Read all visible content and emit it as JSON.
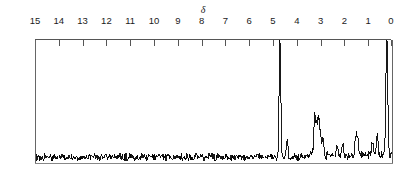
{
  "figure": {
    "kind": "nmr-spectrum",
    "axis_symbol": "δ",
    "width": 401,
    "height": 172,
    "stroke_color": "#000000",
    "frame_color": "#555555",
    "background": "#ffffff"
  },
  "chart_data": {
    "type": "line",
    "title": "",
    "xlabel": "δ",
    "ylabel": "",
    "xlim": [
      15,
      0
    ],
    "ylim": [
      0,
      1
    ],
    "grid": false,
    "legend": null,
    "axis_reversed": true,
    "tick_labels": [
      "15",
      "14",
      "13",
      "12",
      "11",
      "10",
      "9",
      "8",
      "7",
      "6",
      "5",
      "4",
      "3",
      "2",
      "1",
      "0"
    ],
    "tick_values": [
      15,
      14,
      13,
      12,
      11,
      10,
      9,
      8,
      7,
      6,
      5,
      4,
      3,
      2,
      1,
      0
    ],
    "annotations": [
      {
        "text": "δ",
        "x": 8.05,
        "y": 1.06
      }
    ],
    "peaks": [
      {
        "x": 4.72,
        "height": 1.0,
        "width": 0.045,
        "label": ""
      },
      {
        "x": 0.22,
        "height": 1.0,
        "width": 0.05,
        "label": ""
      },
      {
        "x": 3.26,
        "height": 0.3,
        "width": 0.05,
        "label": ""
      },
      {
        "x": 3.18,
        "height": 0.22,
        "width": 0.05,
        "label": ""
      },
      {
        "x": 3.1,
        "height": 0.27,
        "width": 0.05,
        "label": ""
      },
      {
        "x": 3.02,
        "height": 0.18,
        "width": 0.05,
        "label": ""
      },
      {
        "x": 2.92,
        "height": 0.13,
        "width": 0.05,
        "label": ""
      },
      {
        "x": 1.52,
        "height": 0.15,
        "width": 0.05,
        "label": ""
      },
      {
        "x": 1.44,
        "height": 0.12,
        "width": 0.05,
        "label": ""
      },
      {
        "x": 0.82,
        "height": 0.13,
        "width": 0.05,
        "label": ""
      },
      {
        "x": 0.62,
        "height": 0.16,
        "width": 0.05,
        "label": ""
      },
      {
        "x": 4.42,
        "height": 0.12,
        "width": 0.05,
        "label": ""
      },
      {
        "x": 2.3,
        "height": 0.09,
        "width": 0.05,
        "label": ""
      },
      {
        "x": 2.08,
        "height": 0.08,
        "width": 0.05,
        "label": ""
      }
    ],
    "baseline_noise": {
      "amplitude": 0.055,
      "description": "random noise along baseline across full 15–0 ppm range"
    },
    "series": [
      {
        "name": "1H NMR trace",
        "x": [
          15.0,
          14.9,
          14.8,
          14.7,
          14.6,
          14.5,
          14.4,
          14.3,
          14.2,
          14.1,
          14.0,
          13.9,
          13.8,
          13.7,
          13.6,
          13.5,
          13.4,
          13.3,
          13.2,
          13.1,
          13.0,
          12.9,
          12.8,
          12.7,
          12.6,
          12.5,
          12.4,
          12.3,
          12.2,
          12.1,
          12.0,
          11.9,
          11.8,
          11.7,
          11.6,
          11.5,
          11.4,
          11.3,
          11.2,
          11.1,
          11.0,
          10.9,
          10.8,
          10.7,
          10.6,
          10.5,
          10.4,
          10.3,
          10.2,
          10.1,
          10.0,
          9.9,
          9.8,
          9.7,
          9.6,
          9.5,
          9.4,
          9.3,
          9.2,
          9.1,
          9.0,
          8.9,
          8.8,
          8.7,
          8.6,
          8.5,
          8.4,
          8.3,
          8.2,
          8.1,
          8.0,
          7.9,
          7.8,
          7.7,
          7.6,
          7.5,
          7.4,
          7.3,
          7.2,
          7.1,
          7.0,
          6.9,
          6.8,
          6.7,
          6.6,
          6.5,
          6.4,
          6.3,
          6.2,
          6.1,
          6.0,
          5.9,
          5.8,
          5.7,
          5.6,
          5.5,
          5.4,
          5.3,
          5.2,
          5.1,
          5.0,
          4.9,
          4.8,
          4.72,
          4.6,
          4.5,
          4.4,
          4.3,
          4.2,
          4.1,
          4.0,
          3.9,
          3.8,
          3.7,
          3.6,
          3.5,
          3.4,
          3.3,
          3.2,
          3.1,
          3.0,
          2.9,
          2.8,
          2.7,
          2.6,
          2.5,
          2.4,
          2.3,
          2.2,
          2.1,
          2.0,
          1.9,
          1.8,
          1.7,
          1.6,
          1.5,
          1.4,
          1.3,
          1.2,
          1.1,
          1.0,
          0.9,
          0.8,
          0.7,
          0.6,
          0.5,
          0.4,
          0.3,
          0.22,
          0.1,
          0.0
        ],
        "y": [
          0.04,
          0.06,
          0.03,
          0.07,
          0.04,
          0.05,
          0.08,
          0.03,
          0.06,
          0.04,
          0.07,
          0.05,
          0.03,
          0.08,
          0.04,
          0.06,
          0.05,
          0.03,
          0.07,
          0.04,
          0.06,
          0.08,
          0.03,
          0.05,
          0.07,
          0.04,
          0.06,
          0.03,
          0.08,
          0.05,
          0.04,
          0.07,
          0.06,
          0.03,
          0.05,
          0.08,
          0.04,
          0.06,
          0.03,
          0.07,
          0.05,
          0.04,
          0.08,
          0.06,
          0.03,
          0.05,
          0.07,
          0.04,
          0.06,
          0.08,
          0.03,
          0.05,
          0.04,
          0.07,
          0.06,
          0.03,
          0.08,
          0.05,
          0.04,
          0.06,
          0.07,
          0.03,
          0.05,
          0.08,
          0.04,
          0.06,
          0.03,
          0.07,
          0.05,
          0.04,
          0.08,
          0.06,
          0.03,
          0.05,
          0.07,
          0.04,
          0.06,
          0.08,
          0.03,
          0.05,
          0.04,
          0.07,
          0.06,
          0.03,
          0.08,
          0.05,
          0.04,
          0.06,
          0.07,
          0.03,
          0.05,
          0.08,
          0.04,
          0.06,
          0.03,
          0.07,
          0.05,
          0.04,
          0.08,
          0.09,
          0.06,
          0.05,
          0.07,
          1.0,
          0.08,
          0.05,
          0.12,
          0.06,
          0.04,
          0.07,
          0.05,
          0.08,
          0.06,
          0.04,
          0.09,
          0.07,
          0.05,
          0.3,
          0.22,
          0.27,
          0.18,
          0.13,
          0.07,
          0.05,
          0.08,
          0.06,
          0.04,
          0.09,
          0.08,
          0.06,
          0.05,
          0.07,
          0.04,
          0.09,
          0.06,
          0.15,
          0.12,
          0.07,
          0.05,
          0.08,
          0.06,
          0.1,
          0.13,
          0.09,
          0.16,
          0.07,
          0.05,
          0.09,
          1.0,
          0.08,
          0.05
        ]
      }
    ]
  }
}
